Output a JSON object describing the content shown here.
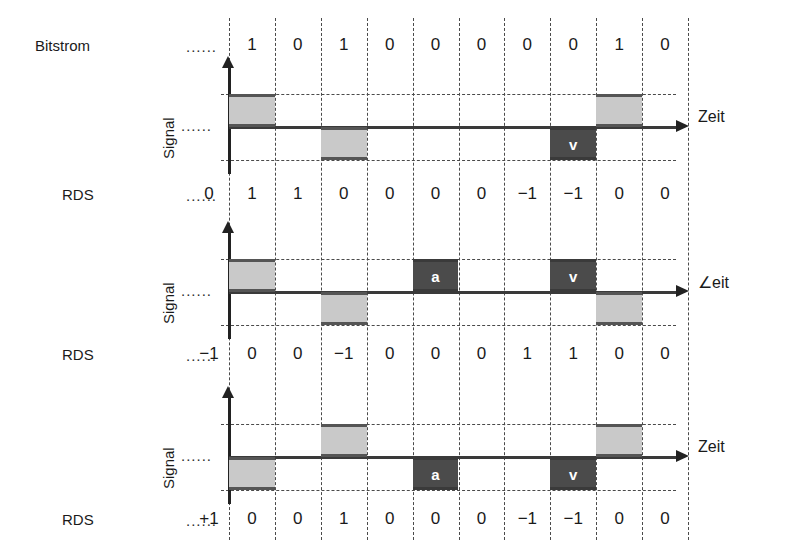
{
  "labels": {
    "bitstream": "Bitstrom",
    "signal": "Signal",
    "rds": "RDS",
    "time_axis": "Zeit",
    "time_axis_alt": "∠eit",
    "leading_dots": "......"
  },
  "colors": {
    "pulse_normal": "#c9c9c9",
    "pulse_special": "#4b4b4b",
    "line": "#3a3a3a",
    "grid": "#4a4a4a",
    "text": "#1a1a1a"
  },
  "bitstream": {
    "label": "Bitstrom",
    "bits": [
      "1",
      "0",
      "1",
      "0",
      "0",
      "0",
      "0",
      "0",
      "1",
      "0"
    ]
  },
  "diagrams": [
    {
      "id": "diagram-1",
      "signal_label": "Signal",
      "axis_label": "Zeit",
      "rds_label": "RDS",
      "rds_initial": "0",
      "rds_values": [
        "1",
        "1",
        "0",
        "0",
        "0",
        "0",
        "-1",
        "-1",
        "0",
        "0"
      ],
      "pulses": [
        {
          "bit": 1,
          "level": "positive",
          "style": "normal",
          "mark": ""
        },
        {
          "bit": 3,
          "level": "negative",
          "style": "normal",
          "mark": ""
        },
        {
          "bit": 8,
          "level": "negative",
          "style": "special",
          "mark": "v"
        },
        {
          "bit": 9,
          "level": "positive",
          "style": "normal",
          "mark": ""
        }
      ]
    },
    {
      "id": "diagram-2",
      "signal_label": "Signal",
      "axis_label": "∠eit",
      "rds_label": "RDS",
      "rds_initial": "-1",
      "rds_values": [
        "0",
        "0",
        "-1",
        "0",
        "0",
        "0",
        "1",
        "1",
        "0",
        "0"
      ],
      "pulses": [
        {
          "bit": 1,
          "level": "positive",
          "style": "normal",
          "mark": ""
        },
        {
          "bit": 3,
          "level": "negative",
          "style": "normal",
          "mark": ""
        },
        {
          "bit": 5,
          "level": "positive",
          "style": "special",
          "mark": "a"
        },
        {
          "bit": 8,
          "level": "positive",
          "style": "special",
          "mark": "v"
        },
        {
          "bit": 9,
          "level": "negative",
          "style": "normal",
          "mark": ""
        }
      ]
    },
    {
      "id": "diagram-3",
      "signal_label": "Signal",
      "axis_label": "Zeit",
      "rds_label": "RDS",
      "rds_initial": "+1",
      "rds_values": [
        "0",
        "0",
        "1",
        "0",
        "0",
        "0",
        "-1",
        "-1",
        "0",
        "0"
      ],
      "pulses": [
        {
          "bit": 1,
          "level": "negative",
          "style": "normal",
          "mark": ""
        },
        {
          "bit": 3,
          "level": "positive",
          "style": "normal",
          "mark": ""
        },
        {
          "bit": 5,
          "level": "negative",
          "style": "special",
          "mark": "a"
        },
        {
          "bit": 8,
          "level": "negative",
          "style": "special",
          "mark": "v"
        },
        {
          "bit": 9,
          "level": "positive",
          "style": "normal",
          "mark": ""
        }
      ]
    }
  ],
  "geometry": {
    "grid_left": 229,
    "col_width": 45.9,
    "columns": 10,
    "grid_top": 18,
    "grid_bottom": 540,
    "bitstream_y": 47,
    "diagram_baselines": [
      127,
      292,
      457
    ],
    "level_offset": 33,
    "rds_rows_y": [
      196,
      356,
      521
    ],
    "axis_arrow_x": 676,
    "rds_initial_x": 211,
    "dots_x": 186
  }
}
